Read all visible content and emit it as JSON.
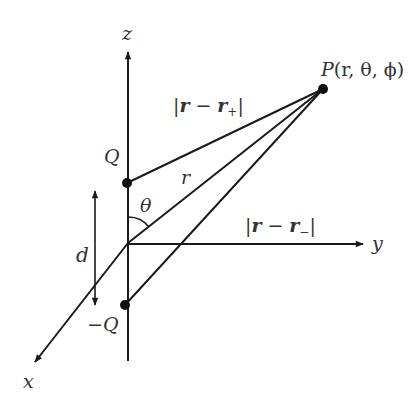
{
  "diagram": {
    "axes": {
      "z_label": "z",
      "y_label": "y",
      "x_label": "x"
    },
    "charges": {
      "positive_label": "Q",
      "negative_label": "−Q"
    },
    "point": {
      "label_main": "P",
      "label_args": "(r, θ, ϕ)"
    },
    "distances": {
      "r_label": "r",
      "plus_distance_bar_open": "|",
      "plus_distance_r": "r",
      "plus_distance_minus": "−",
      "plus_distance_r2": "r",
      "plus_distance_sub": "+",
      "plus_distance_bar_close": "|",
      "minus_distance_bar_open": "|",
      "minus_distance_r": "r",
      "minus_distance_minus": "−",
      "minus_distance_r2": "r",
      "minus_distance_sub": "−",
      "minus_distance_bar_close": "|",
      "separation_label": "d"
    },
    "angle": {
      "theta_label": "θ"
    },
    "colors": {
      "stroke": "#1a1a1a",
      "text": "#333333",
      "background": "#ffffff"
    }
  }
}
